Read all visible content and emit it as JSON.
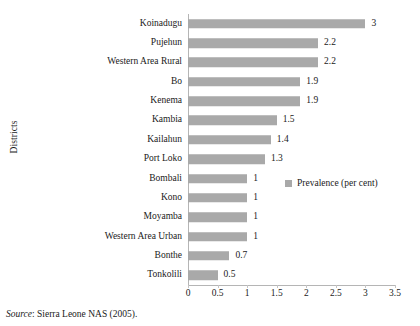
{
  "chart_data": {
    "type": "bar",
    "orientation": "horizontal",
    "title": "",
    "xlabel": "",
    "ylabel": "Districts",
    "xlim": [
      0,
      3.5
    ],
    "xticks": [
      0,
      0.5,
      1,
      1.5,
      2,
      2.5,
      3,
      3.5
    ],
    "xtick_labels": [
      "0",
      "0.5",
      "1",
      "1.5",
      "2",
      "2.5",
      "3",
      "3.5"
    ],
    "grid": false,
    "legend": {
      "position": "right-middle",
      "entries": [
        {
          "label": "Prevalence (per cent)",
          "color": "#a9a9a9"
        }
      ]
    },
    "series": [
      {
        "name": "Prevalence (per cent)",
        "color": "#a9a9a9",
        "values": [
          3,
          2.2,
          2.2,
          1.9,
          1.9,
          1.5,
          1.4,
          1.3,
          1,
          1,
          1,
          1,
          0.7,
          0.5
        ]
      }
    ],
    "categories": [
      "Koinadugu",
      "Pujehun",
      "Western Area Rural",
      "Bo",
      "Kenema",
      "Kambia",
      "Kailahun",
      "Port Loko",
      "Bombali",
      "Kono",
      "Moyamba",
      "Western Area Urban",
      "Bonthe",
      "Tonkolili"
    ],
    "data_labels": [
      "3",
      "2.2",
      "2.2",
      "1.9",
      "1.9",
      "1.5",
      "1.4",
      "1.3",
      "1",
      "1",
      "1",
      "1",
      "0.7",
      "0.5"
    ]
  },
  "caption": {
    "source_word": "Source",
    "source_text": ": Sierra Leone NAS (2005)."
  },
  "colors": {
    "bar": "#a9a9a9",
    "axis": "#b5b5b5",
    "text": "#1a1a1a",
    "background": "#ffffff"
  }
}
